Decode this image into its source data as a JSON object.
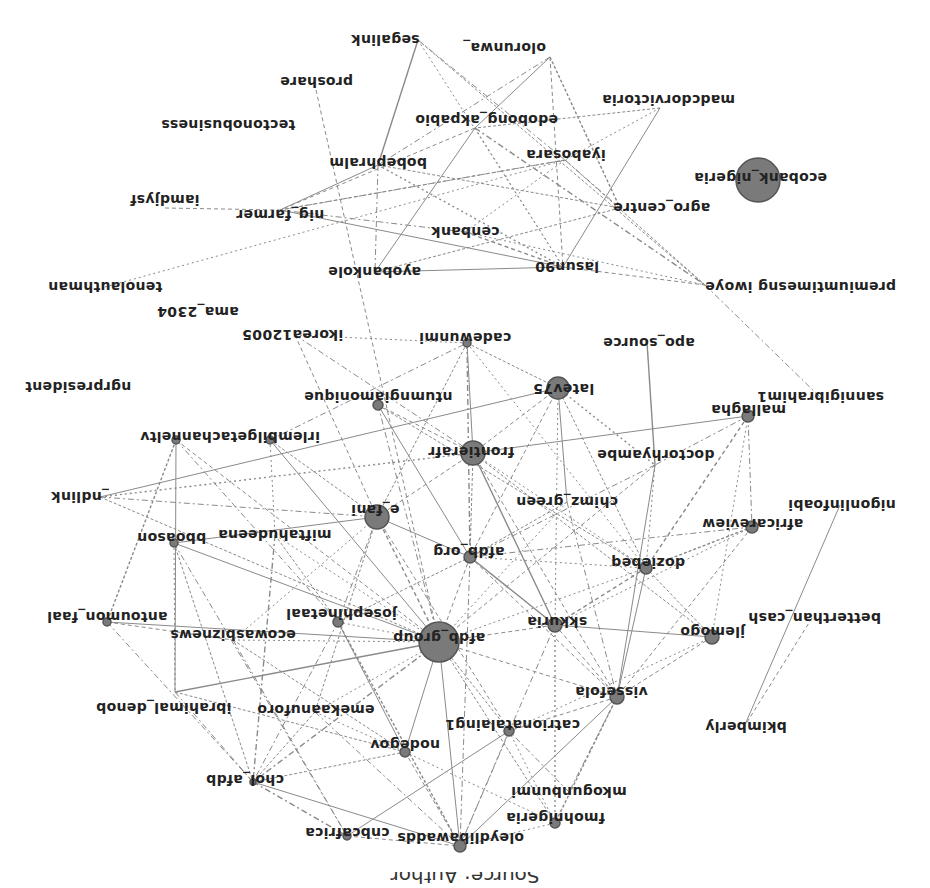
{
  "orientation": "rotated-180",
  "colors": {
    "node_fill": "#7a7a7a",
    "node_stroke": "#555555",
    "edge": "#8a8a8a",
    "label": "#222222",
    "background": "#ffffff"
  },
  "nodes": [
    {
      "id": "segalink",
      "label": "segalink",
      "x": 418,
      "y": 40,
      "lx": 385,
      "ly": 40,
      "r": 0
    },
    {
      "id": "olorunwa_",
      "label": "olorunwa_",
      "x": 550,
      "y": 57,
      "lx": 504,
      "ly": 48,
      "r": 0
    },
    {
      "id": "proshare",
      "label": "proshare",
      "x": 316,
      "y": 90,
      "lx": 316,
      "ly": 82,
      "r": 0
    },
    {
      "id": "madcdorvictoria",
      "label": "madcdorvictoria",
      "x": 660,
      "y": 108,
      "lx": 668,
      "ly": 100,
      "r": 0
    },
    {
      "id": "tectonobusiness",
      "label": "tectonobusiness",
      "x": 228,
      "y": 125,
      "lx": 228,
      "ly": 125,
      "r": 0
    },
    {
      "id": "edobong_akpabio",
      "label": "edobong_akpabio",
      "x": 475,
      "y": 128,
      "lx": 486,
      "ly": 120,
      "r": 0
    },
    {
      "id": "iyabosara",
      "label": "iyabosara",
      "x": 565,
      "y": 160,
      "lx": 566,
      "ly": 155,
      "r": 0
    },
    {
      "id": "bobephralm",
      "label": "bobephralm",
      "x": 378,
      "y": 165,
      "lx": 378,
      "ly": 163,
      "r": 0
    },
    {
      "id": "ecobank_nigeria",
      "label": "ecobank_nigeria",
      "x": 758,
      "y": 180,
      "lx": 760,
      "ly": 178,
      "r": 22
    },
    {
      "id": "iamdjysf",
      "label": "iamdjysf",
      "x": 165,
      "y": 208,
      "lx": 165,
      "ly": 200,
      "r": 0
    },
    {
      "id": "nig_farmer",
      "label": "nig_farmer",
      "x": 280,
      "y": 210,
      "lx": 280,
      "ly": 215,
      "r": 0
    },
    {
      "id": "agro_centre",
      "label": "agro_centre",
      "x": 620,
      "y": 208,
      "lx": 661,
      "ly": 208,
      "r": 0
    },
    {
      "id": "cenbank",
      "label": "cenbank",
      "x": 465,
      "y": 232,
      "lx": 465,
      "ly": 232,
      "r": 0
    },
    {
      "id": "ayobankole",
      "label": "ayobankole",
      "x": 375,
      "y": 272,
      "lx": 374,
      "ly": 272,
      "r": 0
    },
    {
      "id": "lasun90",
      "label": "lasun90",
      "x": 563,
      "y": 267,
      "lx": 567,
      "ly": 267,
      "r": 0
    },
    {
      "id": "premiumtimesng_iwoye",
      "label": "premiumtimesng iwoye",
      "x": 705,
      "y": 285,
      "lx": 800,
      "ly": 287,
      "r": 0
    },
    {
      "id": "tenolauthman",
      "label": "tenolauthman",
      "x": 105,
      "y": 287,
      "lx": 105,
      "ly": 287,
      "r": 0
    },
    {
      "id": "ama_2304",
      "label": "ama_2304",
      "x": 198,
      "y": 312,
      "lx": 198,
      "ly": 312,
      "r": 0
    },
    {
      "id": "ikorea12005",
      "label": "ikorea12005",
      "x": 295,
      "y": 335,
      "lx": 292,
      "ly": 335,
      "r": 0
    },
    {
      "id": "cadewunmi",
      "label": "cadewunmi",
      "x": 467,
      "y": 343,
      "lx": 465,
      "ly": 338,
      "r": 4
    },
    {
      "id": "apo_source",
      "label": "apo_source",
      "x": 647,
      "y": 342,
      "lx": 649,
      "ly": 343,
      "r": 0
    },
    {
      "id": "ngrpresident",
      "label": "ngrpresident",
      "x": 78,
      "y": 387,
      "lx": 78,
      "ly": 387,
      "r": 0
    },
    {
      "id": "ntumngiamonique",
      "label": "ntumngiamonique",
      "x": 378,
      "y": 405,
      "lx": 378,
      "ly": 397,
      "r": 5
    },
    {
      "id": "latev75",
      "label": "latev75",
      "x": 558,
      "y": 388,
      "lx": 563,
      "ly": 389,
      "r": 11
    },
    {
      "id": "sannigibrahim1",
      "label": "sannigibrahim1",
      "x": 820,
      "y": 397,
      "lx": 820,
      "ly": 397,
      "r": 0
    },
    {
      "id": "mallagha",
      "label": "mallagha",
      "x": 748,
      "y": 416,
      "lx": 748,
      "ly": 410,
      "r": 6
    },
    {
      "id": "irlembilgetachanneltv",
      "label": "irlembilgetachanneltv",
      "x": 270,
      "y": 440,
      "lx": 230,
      "ly": 437,
      "r": 4
    },
    {
      "id": "chanelstv_node",
      "label": "",
      "x": 176,
      "y": 440,
      "lx": 0,
      "ly": 0,
      "r": 4
    },
    {
      "id": "frontierafr",
      "label": "frontierafr",
      "x": 473,
      "y": 453,
      "lx": 471,
      "ly": 452,
      "r": 12
    },
    {
      "id": "doctorhyambe",
      "label": "doctorhyambe",
      "x": 655,
      "y": 465,
      "lx": 655,
      "ly": 455,
      "r": 0
    },
    {
      "id": "_ndlink",
      "label": "_ndlink",
      "x": 100,
      "y": 497,
      "lx": 80,
      "ly": 497,
      "r": 0
    },
    {
      "id": "chimz_green",
      "label": "chimz_green",
      "x": 567,
      "y": 502,
      "lx": 567,
      "ly": 502,
      "r": 0
    },
    {
      "id": "e_fani",
      "label": "e_fani",
      "x": 377,
      "y": 517,
      "lx": 375,
      "ly": 510,
      "r": 12
    },
    {
      "id": "africareview",
      "label": "africareview",
      "x": 752,
      "y": 527,
      "lx": 752,
      "ly": 524,
      "r": 6
    },
    {
      "id": "nigonlinfoabi",
      "label": "nigonlinfoabi",
      "x": 840,
      "y": 505,
      "lx": 842,
      "ly": 505,
      "r": 0
    },
    {
      "id": "miftahudeena",
      "label": "miftahudeena",
      "x": 275,
      "y": 535,
      "lx": 275,
      "ly": 535,
      "r": 0
    },
    {
      "id": "bboason",
      "label": "bboason",
      "x": 174,
      "y": 543,
      "lx": 171,
      "ly": 538,
      "r": 4
    },
    {
      "id": "afdb_org",
      "label": "afdb_org",
      "x": 470,
      "y": 557,
      "lx": 469,
      "ly": 552,
      "r": 6
    },
    {
      "id": "doziebeq",
      "label": "doziebeq",
      "x": 646,
      "y": 568,
      "lx": 648,
      "ly": 563,
      "r": 6
    },
    {
      "id": "antoumon_faal",
      "label": "antoumon_faal",
      "x": 107,
      "y": 622,
      "lx": 107,
      "ly": 617,
      "r": 4
    },
    {
      "id": "josephinetaal",
      "label": "josephinetaal",
      "x": 338,
      "y": 622,
      "lx": 341,
      "ly": 614,
      "r": 5
    },
    {
      "id": "ecowasbiznews",
      "label": "ecowasbiznews",
      "x": 233,
      "y": 640,
      "lx": 233,
      "ly": 635,
      "r": 0
    },
    {
      "id": "afdb_group",
      "label": "afdb_group",
      "x": 439,
      "y": 642,
      "lx": 439,
      "ly": 638,
      "r": 20
    },
    {
      "id": "skkuria",
      "label": "skkuria",
      "x": 555,
      "y": 625,
      "lx": 557,
      "ly": 622,
      "r": 7
    },
    {
      "id": "jlemogo",
      "label": "jlemogo",
      "x": 712,
      "y": 637,
      "lx": 712,
      "ly": 632,
      "r": 7
    },
    {
      "id": "betterthan_cash",
      "label": "betterthan_cash",
      "x": 812,
      "y": 618,
      "lx": 814,
      "ly": 618,
      "r": 0
    },
    {
      "id": "ibrahimal_denob",
      "label": "ibrahimal_denob",
      "x": 175,
      "y": 692,
      "lx": 163,
      "ly": 708,
      "r": 0
    },
    {
      "id": "emekaanuforo",
      "label": "emekaanuforo",
      "x": 315,
      "y": 712,
      "lx": 316,
      "ly": 710,
      "r": 0
    },
    {
      "id": "vissefola",
      "label": "vissefola",
      "x": 617,
      "y": 697,
      "lx": 611,
      "ly": 692,
      "r": 7
    },
    {
      "id": "catrionatalaing1",
      "label": "catrionatalaing1",
      "x": 509,
      "y": 731,
      "lx": 512,
      "ly": 725,
      "r": 5
    },
    {
      "id": "nodegov",
      "label": "nodegov",
      "x": 405,
      "y": 752,
      "lx": 405,
      "ly": 745,
      "r": 5
    },
    {
      "id": "bkimberly",
      "label": "bkimberly",
      "x": 744,
      "y": 727,
      "lx": 746,
      "ly": 727,
      "r": 0
    },
    {
      "id": "chol_afdb",
      "label": "chol_afdb",
      "x": 253,
      "y": 782,
      "lx": 245,
      "ly": 780,
      "r": 3
    },
    {
      "id": "mkogunbunmi",
      "label": "mkogunbunmi",
      "x": 569,
      "y": 792,
      "lx": 569,
      "ly": 792,
      "r": 0
    },
    {
      "id": "fmohnigeria",
      "label": "fmohnigeria",
      "x": 555,
      "y": 823,
      "lx": 555,
      "ly": 818,
      "r": 5
    },
    {
      "id": "cnbcafrica",
      "label": "cnbcafrica",
      "x": 347,
      "y": 836,
      "lx": 347,
      "ly": 833,
      "r": 4
    },
    {
      "id": "oleydlibawadds",
      "label": "oleydlibawadds",
      "x": 460,
      "y": 846,
      "lx": 460,
      "ly": 838,
      "r": 6
    }
  ],
  "edges": [
    [
      "segalink",
      "bobephralm"
    ],
    [
      "segalink",
      "lasun90"
    ],
    [
      "segalink",
      "iyabosara"
    ],
    [
      "segalink",
      "premiumtimesng_iwoye"
    ],
    [
      "olorunwa_",
      "lasun90"
    ],
    [
      "olorunwa_",
      "edobong_akpabio"
    ],
    [
      "olorunwa_",
      "bobephralm"
    ],
    [
      "olorunwa_",
      "agro_centre"
    ],
    [
      "proshare",
      "afdb_group"
    ],
    [
      "madcdorvictoria",
      "iyabosara"
    ],
    [
      "madcdorvictoria",
      "lasun90"
    ],
    [
      "madcdorvictoria",
      "edobong_akpabio"
    ],
    [
      "edobong_akpabio",
      "nig_farmer"
    ],
    [
      "edobong_akpabio",
      "lasun90"
    ],
    [
      "edobong_akpabio",
      "premiumtimesng_iwoye"
    ],
    [
      "edobong_akpabio",
      "ayobankole"
    ],
    [
      "iyabosara",
      "nig_farmer"
    ],
    [
      "iyabosara",
      "cenbank"
    ],
    [
      "iyabosara",
      "agro_centre"
    ],
    [
      "iyabosara",
      "premiumtimesng_iwoye"
    ],
    [
      "bobephralm",
      "nig_farmer"
    ],
    [
      "bobephralm",
      "lasun90"
    ],
    [
      "bobephralm",
      "ayobankole"
    ],
    [
      "bobephralm",
      "agro_centre"
    ],
    [
      "iamdjysf",
      "nig_farmer"
    ],
    [
      "nig_farmer",
      "lasun90"
    ],
    [
      "nig_farmer",
      "cenbank"
    ],
    [
      "nig_farmer",
      "iyabosara"
    ],
    [
      "cenbank",
      "lasun90"
    ],
    [
      "cenbank",
      "premiumtimesng_iwoye"
    ],
    [
      "ayobankole",
      "lasun90"
    ],
    [
      "ayobankole",
      "agro_centre"
    ],
    [
      "lasun90",
      "premiumtimesng_iwoye"
    ],
    [
      "tenolauthman",
      "iyabosara"
    ],
    [
      "premiumtimesng_iwoye",
      "sannigibrahim1"
    ],
    [
      "apo_source",
      "doctorhyambe"
    ],
    [
      "ikorea12005",
      "e_fani"
    ],
    [
      "ikorea12005",
      "cadewunmi"
    ],
    [
      "ikorea12005",
      "frontierafr"
    ],
    [
      "cadewunmi",
      "latev75"
    ],
    [
      "cadewunmi",
      "frontierafr"
    ],
    [
      "cadewunmi",
      "doziebeq"
    ],
    [
      "cadewunmi",
      "afdb_org"
    ],
    [
      "cadewunmi",
      "e_fani"
    ],
    [
      "ntumngiamonique",
      "frontierafr"
    ],
    [
      "ntumngiamonique",
      "afdb_org"
    ],
    [
      "ntumngiamonique",
      "afdb_group"
    ],
    [
      "ntumngiamonique",
      "doziebeq"
    ],
    [
      "latev75",
      "frontierafr"
    ],
    [
      "latev75",
      "doctorhyambe"
    ],
    [
      "latev75",
      "chimz_green"
    ],
    [
      "latev75",
      "doziebeq"
    ],
    [
      "latev75",
      "afdb_org"
    ],
    [
      "latev75",
      "skkuria"
    ],
    [
      "mallagha",
      "doctorhyambe"
    ],
    [
      "mallagha",
      "frontierafr"
    ],
    [
      "mallagha",
      "doziebeq"
    ],
    [
      "mallagha",
      "jlemogo"
    ],
    [
      "mallagha",
      "africareview"
    ],
    [
      "irlembilgetachanneltv",
      "e_fani"
    ],
    [
      "irlembilgetachanneltv",
      "afdb_group"
    ],
    [
      "irlembilgetachanneltv",
      "miftahudeena"
    ],
    [
      "irlembilgetachanneltv",
      "cadewunmi"
    ],
    [
      "chanelstv_node",
      "antoumon_faal"
    ],
    [
      "chanelstv_node",
      "afdb_group"
    ],
    [
      "chanelstv_node",
      "ibrahimal_denob"
    ],
    [
      "chanelstv_node",
      "josephinetaal"
    ],
    [
      "frontierafr",
      "afdb_org"
    ],
    [
      "frontierafr",
      "e_fani"
    ],
    [
      "frontierafr",
      "doziebeq"
    ],
    [
      "frontierafr",
      "skkuria"
    ],
    [
      "frontierafr",
      "jlemogo"
    ],
    [
      "frontierafr",
      "vissefola"
    ],
    [
      "doctorhyambe",
      "doziebeq"
    ],
    [
      "doctorhyambe",
      "afdb_org"
    ],
    [
      "doctorhyambe",
      "vissefola"
    ],
    [
      "doctorhyambe",
      "afdb_group"
    ],
    [
      "_ndlink",
      "frontierafr"
    ],
    [
      "_ndlink",
      "e_fani"
    ],
    [
      "_ndlink",
      "afdb_group"
    ],
    [
      "_ndlink",
      "latev75"
    ],
    [
      "chimz_green",
      "afdb_group"
    ],
    [
      "chimz_green",
      "vissefola"
    ],
    [
      "chimz_green",
      "afdb_org"
    ],
    [
      "e_fani",
      "afdb_group"
    ],
    [
      "e_fani",
      "afdb_org"
    ],
    [
      "e_fani",
      "josephinetaal"
    ],
    [
      "e_fani",
      "emekaanuforo"
    ],
    [
      "e_fani",
      "catrionatalaing1"
    ],
    [
      "e_fani",
      "ecowasbiznews"
    ],
    [
      "e_fani",
      "bboason"
    ],
    [
      "africareview",
      "doziebeq"
    ],
    [
      "africareview",
      "vissefola"
    ],
    [
      "africareview",
      "skkuria"
    ],
    [
      "africareview",
      "afdb_org"
    ],
    [
      "nigonlinfoabi",
      "bkimberly"
    ],
    [
      "betterthan_cash",
      "bkimberly"
    ],
    [
      "miftahudeena",
      "afdb_group"
    ],
    [
      "miftahudeena",
      "chol_afdb"
    ],
    [
      "miftahudeena",
      "josephinetaal"
    ],
    [
      "bboason",
      "afdb_group"
    ],
    [
      "bboason",
      "ibrahimal_denob"
    ],
    [
      "bboason",
      "cnbcafrica"
    ],
    [
      "bboason",
      "chol_afdb"
    ],
    [
      "afdb_org",
      "afdb_group"
    ],
    [
      "afdb_org",
      "skkuria"
    ],
    [
      "afdb_org",
      "oleydlibawadds"
    ],
    [
      "afdb_org",
      "josephinetaal"
    ],
    [
      "afdb_org",
      "vissefola"
    ],
    [
      "afdb_org",
      "doziebeq"
    ],
    [
      "doziebeq",
      "vissefola"
    ],
    [
      "doziebeq",
      "jlemogo"
    ],
    [
      "doziebeq",
      "skkuria"
    ],
    [
      "doziebeq",
      "afdb_group"
    ],
    [
      "antoumon_faal",
      "chol_afdb"
    ],
    [
      "antoumon_faal",
      "afdb_group"
    ],
    [
      "antoumon_faal",
      "ecowasbiznews"
    ],
    [
      "josephinetaal",
      "afdb_group"
    ],
    [
      "josephinetaal",
      "chol_afdb"
    ],
    [
      "josephinetaal",
      "oleydlibawadds"
    ],
    [
      "josephinetaal",
      "nodegov"
    ],
    [
      "ecowasbiznews",
      "afdb_group"
    ],
    [
      "ecowasbiznews",
      "cnbcafrica"
    ],
    [
      "ecowasbiznews",
      "nodegov"
    ],
    [
      "afdb_group",
      "skkuria"
    ],
    [
      "afdb_group",
      "nodegov"
    ],
    [
      "afdb_group",
      "chol_afdb"
    ],
    [
      "afdb_group",
      "catrionatalaing1"
    ],
    [
      "afdb_group",
      "vissefola"
    ],
    [
      "afdb_group",
      "emekaanuforo"
    ],
    [
      "afdb_group",
      "oleydlibawadds"
    ],
    [
      "afdb_group",
      "fmohnigeria"
    ],
    [
      "skkuria",
      "vissefola"
    ],
    [
      "skkuria",
      "fmohnigeria"
    ],
    [
      "skkuria",
      "oleydlibawadds"
    ],
    [
      "skkuria",
      "jlemogo"
    ],
    [
      "jlemogo",
      "vissefola"
    ],
    [
      "jlemogo",
      "catrionatalaing1"
    ],
    [
      "ibrahimal_denob",
      "chol_afdb"
    ],
    [
      "ibrahimal_denob",
      "nodegov"
    ],
    [
      "ibrahimal_denob",
      "afdb_group"
    ],
    [
      "emekaanuforo",
      "nodegov"
    ],
    [
      "emekaanuforo",
      "oleydlibawadds"
    ],
    [
      "emekaanuforo",
      "chol_afdb"
    ],
    [
      "vissefola",
      "catrionatalaing1"
    ],
    [
      "vissefola",
      "oleydlibawadds"
    ],
    [
      "vissefola",
      "mkogunbunmi"
    ],
    [
      "vissefola",
      "fmohnigeria"
    ],
    [
      "catrionatalaing1",
      "oleydlibawadds"
    ],
    [
      "catrionatalaing1",
      "fmohnigeria"
    ],
    [
      "catrionatalaing1",
      "cnbcafrica"
    ],
    [
      "nodegov",
      "chol_afdb"
    ],
    [
      "nodegov",
      "oleydlibawadds"
    ],
    [
      "nodegov",
      "fmohnigeria"
    ],
    [
      "chol_afdb",
      "cnbcafrica"
    ],
    [
      "chol_afdb",
      "oleydlibawadds"
    ],
    [
      "cnbcafrica",
      "oleydlibawadds"
    ],
    [
      "oleydlibawadds",
      "fmohnigeria"
    ],
    [
      "mkogunbunmi",
      "catrionatalaing1"
    ]
  ],
  "caption": "Source: Author"
}
